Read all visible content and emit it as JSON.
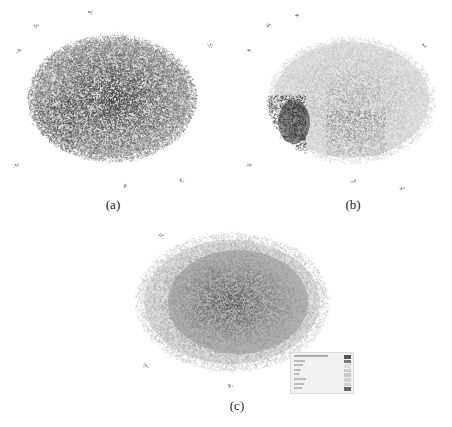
{
  "figure": {
    "panels": [
      {
        "id": "a",
        "caption": "(a)",
        "shading": "uniform-dark",
        "description": "Dense network node cloud, uniformly dark"
      },
      {
        "id": "b",
        "caption": "(b)",
        "shading": "light-with-dark-left-cluster",
        "description": "Network cloud, mostly light grey with dark cluster at left"
      },
      {
        "id": "c",
        "caption": "(c)",
        "shading": "medium-with-light-fringe",
        "description": "Network cloud with light halo and legend box"
      }
    ],
    "legend": {
      "title": "",
      "rows": 8,
      "swatch_colors": [
        "#555555",
        "#777777",
        "#dddddd",
        "#cccccc",
        "#c8c8c8",
        "#d0d0d0",
        "#cfcfcf",
        "#666666"
      ]
    }
  }
}
